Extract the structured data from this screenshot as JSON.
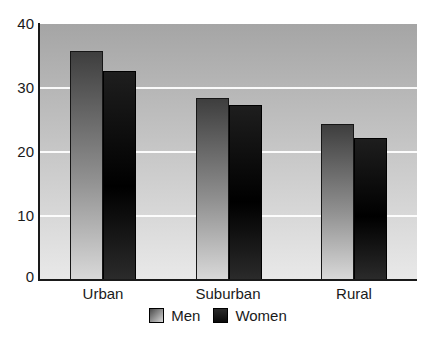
{
  "chart_data": {
    "type": "bar",
    "title": "",
    "xlabel": "",
    "ylabel": "",
    "categories": [
      "Urban",
      "Suburban",
      "Rural"
    ],
    "series": [
      {
        "name": "Men",
        "values": [
          35.8,
          28.5,
          24.4
        ]
      },
      {
        "name": "Women",
        "values": [
          32.6,
          27.3,
          22.2
        ]
      }
    ],
    "ylim": [
      0,
      40
    ],
    "yticks": [
      0,
      10,
      20,
      30,
      40
    ],
    "grid": "horizontal white gridlines at 10, 20, 30",
    "legend_position": "bottom-center",
    "colors": {
      "plot_bg_top": "#a5a5a5",
      "plot_bg_bottom": "#e9e9e9",
      "men_bar_top": "#3e3e3e",
      "men_bar_bottom": "#d9d9d9",
      "women_bar_top": "#1e1e1e",
      "women_bar_bottom": "#2b2b2b",
      "gridline": "#ffffff",
      "axis": "#1a1a1a",
      "text": "#1a1a1a"
    }
  }
}
